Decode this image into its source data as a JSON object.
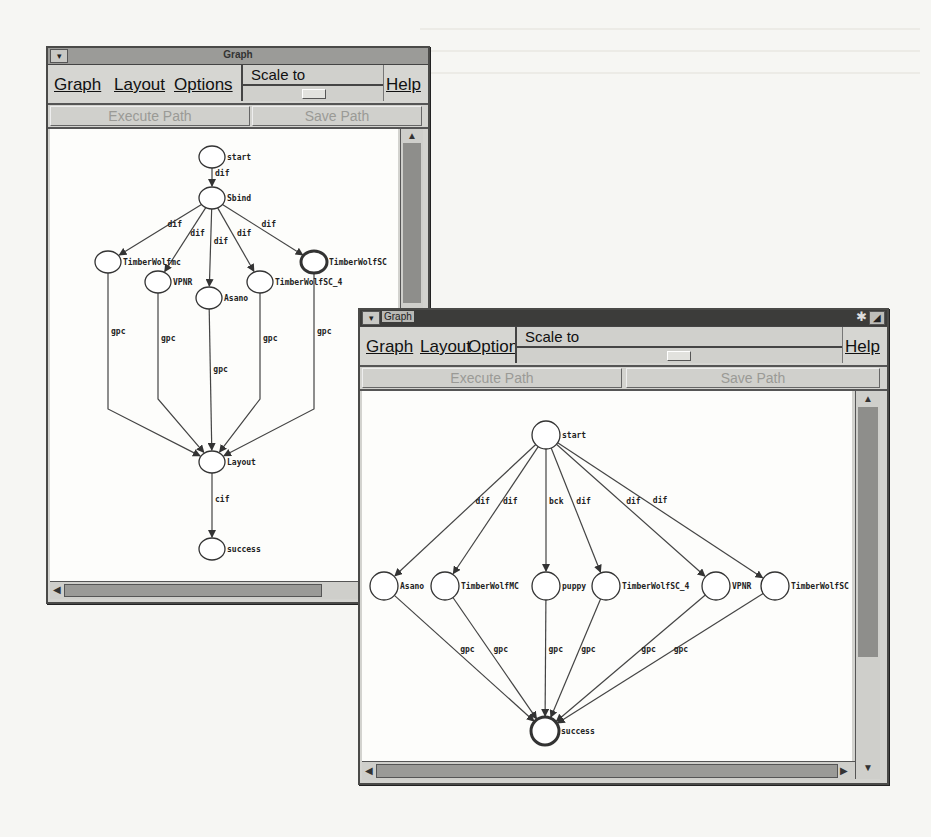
{
  "background_page": {
    "lines": [
      "",
      "",
      "",
      "",
      ""
    ]
  },
  "windows": [
    {
      "title": "Graph",
      "menu": {
        "graph": "Graph",
        "layout": "Layout",
        "options": "Options",
        "help": "Help"
      },
      "scale": {
        "label": "Scale to",
        "value": 0.5
      },
      "buttons": {
        "execute": "Execute Path",
        "save": "Save Path"
      },
      "graph": {
        "nodes": [
          {
            "id": "start",
            "label": "start",
            "bold": false
          },
          {
            "id": "Sbind",
            "label": "Sbind",
            "bold": false
          },
          {
            "id": "TimberWolfmc",
            "label": "TimberWolfmc",
            "bold": false
          },
          {
            "id": "VPNR",
            "label": "VPNR",
            "bold": false
          },
          {
            "id": "Asano",
            "label": "Asano",
            "bold": false
          },
          {
            "id": "TimberWolfSC_4",
            "label": "TimberWolfSC_4",
            "bold": false
          },
          {
            "id": "TimberWolfSC",
            "label": "TimberWolfSC",
            "bold": true
          },
          {
            "id": "Layout",
            "label": "Layout",
            "bold": false
          },
          {
            "id": "success",
            "label": "success",
            "bold": false
          }
        ],
        "edges": [
          {
            "from": "start",
            "to": "Sbind",
            "label": "dif"
          },
          {
            "from": "Sbind",
            "to": "TimberWolfmc",
            "label": "dif"
          },
          {
            "from": "Sbind",
            "to": "VPNR",
            "label": "dif"
          },
          {
            "from": "Sbind",
            "to": "Asano",
            "label": "dif"
          },
          {
            "from": "Sbind",
            "to": "TimberWolfSC_4",
            "label": "dif"
          },
          {
            "from": "Sbind",
            "to": "TimberWolfSC",
            "label": "dif"
          },
          {
            "from": "TimberWolfmc",
            "to": "Layout",
            "label": "gpc"
          },
          {
            "from": "VPNR",
            "to": "Layout",
            "label": "gpc"
          },
          {
            "from": "Asano",
            "to": "Layout",
            "label": "gpc"
          },
          {
            "from": "TimberWolfSC_4",
            "to": "Layout",
            "label": "gpc"
          },
          {
            "from": "TimberWolfSC",
            "to": "Layout",
            "label": "gpc"
          },
          {
            "from": "Layout",
            "to": "success",
            "label": "cif"
          }
        ]
      }
    },
    {
      "title": "Graph",
      "menu": {
        "graph": "Graph",
        "layout": "Layout",
        "options": "Options",
        "help": "Help"
      },
      "scale": {
        "label": "Scale to",
        "value": 0.5
      },
      "buttons": {
        "execute": "Execute Path",
        "save": "Save Path"
      },
      "graph": {
        "nodes": [
          {
            "id": "start",
            "label": "start",
            "bold": false
          },
          {
            "id": "Asano",
            "label": "Asano",
            "bold": false
          },
          {
            "id": "TimberWolfMC",
            "label": "TimberWolfMC",
            "bold": false
          },
          {
            "id": "puppy",
            "label": "puppy",
            "bold": false
          },
          {
            "id": "TimberWolfSC_4",
            "label": "TimberWolfSC_4",
            "bold": false
          },
          {
            "id": "VPNR",
            "label": "VPNR",
            "bold": false
          },
          {
            "id": "TimberWolfSC",
            "label": "TimberWolfSC",
            "bold": false
          },
          {
            "id": "success",
            "label": "success",
            "bold": true
          }
        ],
        "edges": [
          {
            "from": "start",
            "to": "Asano",
            "label": "dif"
          },
          {
            "from": "start",
            "to": "TimberWolfMC",
            "label": "dif"
          },
          {
            "from": "start",
            "to": "puppy",
            "label": "bck"
          },
          {
            "from": "start",
            "to": "TimberWolfSC_4",
            "label": "dif"
          },
          {
            "from": "start",
            "to": "VPNR",
            "label": "dif"
          },
          {
            "from": "start",
            "to": "TimberWolfSC",
            "label": "dif"
          },
          {
            "from": "Asano",
            "to": "success",
            "label": "gpc"
          },
          {
            "from": "TimberWolfMC",
            "to": "success",
            "label": "gpc"
          },
          {
            "from": "puppy",
            "to": "success",
            "label": "gpc"
          },
          {
            "from": "TimberWolfSC_4",
            "to": "success",
            "label": "gpc"
          },
          {
            "from": "VPNR",
            "to": "success",
            "label": "gpc"
          },
          {
            "from": "TimberWolfSC",
            "to": "success",
            "label": "gpc"
          }
        ]
      }
    }
  ]
}
